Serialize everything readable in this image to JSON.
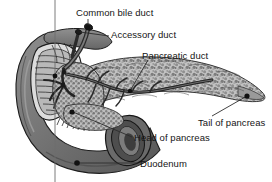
{
  "figure": {
    "background_color": "#ffffff",
    "text_color": "#151515",
    "width": 272,
    "height": 182
  },
  "labels": {
    "common_bile_duct": "Common bile duct",
    "accessory_duct": "Accessory duct",
    "pancreatic_duct": "Pancreatic duct",
    "tail_of_pancreas": "Tail of pancreas",
    "head_of_pancreas": "Head of pancreas",
    "duodenum": "Duodenum"
  },
  "bottom_cropped_text": "",
  "colors": {
    "duodenum_fill": "#6e6e6e",
    "duodenum_shadow": "#4a4a4a",
    "duodenum_highlight": "#8c8c8c",
    "pancreas_fill": "#b5b5b5",
    "pancreas_speckle": "#5d5d5d",
    "duct_stroke": "#2a2a2a",
    "leader_line": "#333333",
    "outline": "#1a1a1a"
  },
  "structures": [
    {
      "name": "duodenum",
      "label": "Duodenum",
      "kind": "C-shaped tube, dark gray, left and bottom of figure"
    },
    {
      "name": "head-of-pancreas",
      "label": "Head of pancreas",
      "kind": "pancreatic tissue nestled in duodenal curve"
    },
    {
      "name": "tail-of-pancreas",
      "label": "Tail of pancreas",
      "kind": "tapering right end of pancreas"
    },
    {
      "name": "pancreatic-duct",
      "label": "Pancreatic duct",
      "kind": "main duct running length of pancreas"
    },
    {
      "name": "accessory-duct",
      "label": "Accessory duct",
      "kind": "smaller duct superior to main duct"
    },
    {
      "name": "common-bile-duct",
      "label": "Common bile duct",
      "kind": "duct entering from superior left"
    }
  ]
}
